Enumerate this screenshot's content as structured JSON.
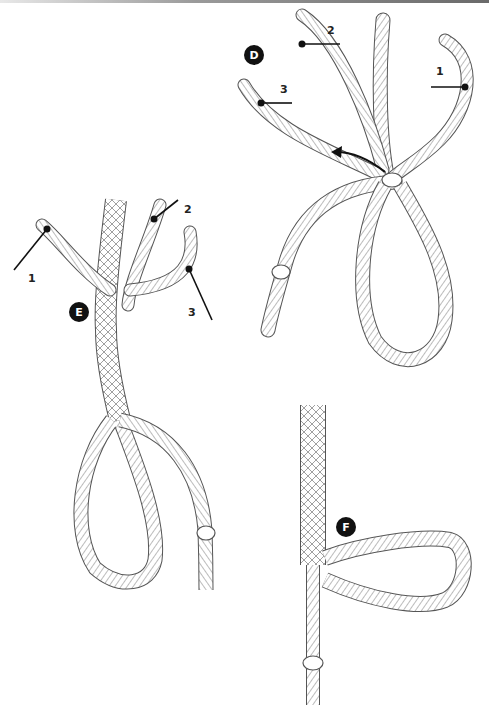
{
  "figure": {
    "steps": [
      {
        "id": "D",
        "label": "D",
        "strand_labels": [
          "1",
          "2",
          "3"
        ],
        "has_arrow": true
      },
      {
        "id": "E",
        "label": "E",
        "strand_labels": [
          "1",
          "2",
          "3"
        ]
      },
      {
        "id": "F",
        "label": "F",
        "strand_labels": []
      }
    ]
  },
  "labels": {
    "D": "D",
    "E": "E",
    "F": "F",
    "d_strand1": "1",
    "d_strand2": "2",
    "d_strand3": "3",
    "e_strand1": "1",
    "e_strand2": "2",
    "e_strand3": "3"
  },
  "colors": {
    "rope_outline": "#555555",
    "rope_hatch": "#6a6a6a",
    "leader": "#111111",
    "badge": "#111111"
  }
}
